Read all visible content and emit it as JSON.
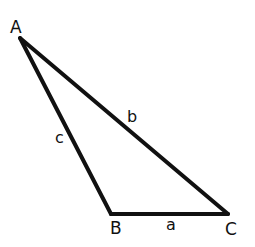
{
  "diagram": {
    "type": "triangle",
    "stroke_color": "#111111",
    "background": "#ffffff",
    "vertices": [
      {
        "label": "A",
        "x": 20,
        "y": 38
      },
      {
        "label": "B",
        "x": 111,
        "y": 214
      },
      {
        "label": "C",
        "x": 228,
        "y": 214
      }
    ],
    "sides": [
      {
        "label": "a",
        "between": "B-C"
      },
      {
        "label": "b",
        "between": "A-C"
      },
      {
        "label": "c",
        "between": "A-B"
      }
    ]
  }
}
